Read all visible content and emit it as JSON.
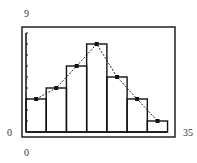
{
  "window": {
    "ymax_label": "9",
    "ymin_label": "0",
    "xmin_label": "0",
    "xmax_label": "35"
  },
  "colors": {
    "stroke": "#111111",
    "frame": "#222222",
    "background": "#ffffff"
  },
  "chart_data": {
    "type": "bar",
    "subtype": "histogram with frequency polygon",
    "title": "",
    "xlabel": "",
    "ylabel": "",
    "xlim": [
      0,
      35
    ],
    "ylim": [
      0,
      9
    ],
    "y_tick_step": 1,
    "grid": false,
    "legend": null,
    "bins": [
      {
        "start": 0.0,
        "end": 4.75
      },
      {
        "start": 4.75,
        "end": 9.5
      },
      {
        "start": 9.5,
        "end": 14.25
      },
      {
        "start": 14.25,
        "end": 19.0
      },
      {
        "start": 19.0,
        "end": 23.75
      },
      {
        "start": 23.75,
        "end": 28.5
      },
      {
        "start": 28.5,
        "end": 33.25
      }
    ],
    "values": [
      3,
      4,
      6,
      8,
      5,
      3,
      1
    ],
    "series": [
      {
        "name": "histogram",
        "values": [
          3,
          4,
          6,
          8,
          5,
          3,
          1
        ]
      },
      {
        "name": "frequency polygon (midpoints)",
        "x": [
          2.4,
          7.1,
          11.9,
          16.6,
          21.4,
          26.1,
          30.9
        ],
        "values": [
          3,
          4,
          6,
          8,
          5,
          3,
          1
        ]
      }
    ]
  }
}
